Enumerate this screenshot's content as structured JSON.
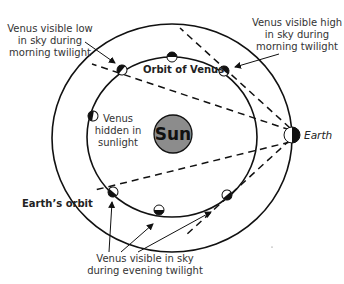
{
  "diagram": {
    "colors": {
      "line": "#111111",
      "sun_fill": "#8c8c8c",
      "background": "#ffffff",
      "text": "#333333"
    },
    "sun": {
      "label": "Sun"
    },
    "earth": {
      "label": "Earth"
    },
    "orbits": {
      "venus_label": "Orbit of Venus",
      "earth_label": "Earth’s orbit"
    },
    "annotations": {
      "morning_low": [
        "Venus visible low",
        "in sky during",
        "morning twilight"
      ],
      "morning_high": [
        "Venus visible high",
        "in sky during",
        "morning twilight"
      ],
      "hidden": [
        "Venus",
        "hidden in",
        "sunlight"
      ],
      "evening": [
        "Venus visible in sky",
        "during evening twilight"
      ]
    },
    "venus_positions": [
      {
        "name": "top",
        "x": 172,
        "y": 57
      },
      {
        "name": "upper-right",
        "x": 224,
        "y": 71
      },
      {
        "name": "upper-left",
        "x": 122,
        "y": 70
      },
      {
        "name": "left",
        "x": 93,
        "y": 116
      },
      {
        "name": "lower-left",
        "x": 113,
        "y": 192
      },
      {
        "name": "bottom",
        "x": 159,
        "y": 210
      },
      {
        "name": "lower-right",
        "x": 227,
        "y": 195
      }
    ]
  }
}
